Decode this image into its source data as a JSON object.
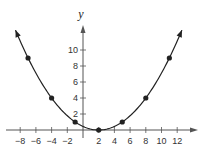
{
  "chart_data": {
    "type": "line",
    "title": "",
    "xlabel": "",
    "ylabel": "y",
    "function": "parabola with vertex at (2, 0)",
    "x": [
      -7,
      -4,
      -1,
      2,
      5,
      8,
      11
    ],
    "series": [
      {
        "name": "curve",
        "values": [
          9,
          4,
          1,
          0,
          1,
          4,
          9
        ],
        "marker": "dot",
        "arrows_at_ends": true
      }
    ],
    "x_ticks": [
      "-8",
      "-6",
      "-4",
      "-2",
      "2",
      "4",
      "6",
      "8",
      "10",
      "12"
    ],
    "y_ticks": [
      "2",
      "4",
      "6",
      "8",
      "10"
    ],
    "xlim": [
      -9,
      14
    ],
    "ylim": [
      -1,
      13
    ],
    "grid": false,
    "legend": "none"
  },
  "axis": {
    "y_label": "y"
  },
  "colors": {
    "ink": "#222222",
    "background": "#ffffff"
  }
}
